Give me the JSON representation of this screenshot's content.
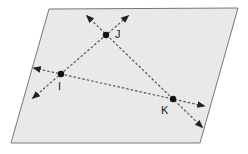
{
  "diagram": {
    "type": "geometry-plane",
    "plane": {
      "points": [
        [
          49,
          9
        ],
        [
          238,
          8
        ],
        [
          200,
          143
        ],
        [
          11,
          143
        ]
      ],
      "fill": "#e9e9e9",
      "stroke": "#777777"
    },
    "points": [
      {
        "name": "I",
        "x": 61,
        "y": 74,
        "label": "I",
        "label_x": 58,
        "label_y": 90
      },
      {
        "name": "J",
        "x": 106,
        "y": 35,
        "label": "J",
        "label_x": 115,
        "label_y": 38
      },
      {
        "name": "K",
        "x": 173,
        "y": 99,
        "label": "K",
        "label_x": 161,
        "label_y": 114
      }
    ],
    "lines": [
      {
        "name": "line-IJ",
        "through": [
          "I",
          "J"
        ],
        "x1": 33,
        "y1": 98,
        "x2": 128,
        "y2": 16
      },
      {
        "name": "line-JK",
        "through": [
          "J",
          "K"
        ],
        "x1": 87,
        "y1": 16,
        "x2": 202,
        "y2": 127
      },
      {
        "name": "line-IK",
        "through": [
          "I",
          "K"
        ],
        "x1": 34,
        "y1": 68,
        "x2": 204,
        "y2": 106
      }
    ],
    "colors": {
      "line": "#555555",
      "point": "#111111",
      "label": "#222222"
    }
  }
}
